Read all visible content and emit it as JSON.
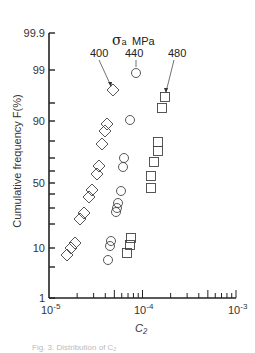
{
  "chart_data": {
    "type": "scatter",
    "title": "",
    "legend_title": "σa MPa",
    "xlabel": "C2",
    "ylabel": "Cumulative frequency  F(%)",
    "xscale": "log",
    "yscale": "probability",
    "xlim": [
      1e-05,
      0.001
    ],
    "ylim": [
      1,
      99.9
    ],
    "x_tick_labels": [
      "10-5",
      "10-4",
      "10-3"
    ],
    "y_tick_labels": [
      "1",
      "10",
      "50",
      "90",
      "99",
      "99.9"
    ],
    "grid": false,
    "series": [
      {
        "name": "400",
        "marker": "diamond",
        "points": [
          [
            4.8e-05,
            96.5
          ],
          [
            4.2e-05,
            88
          ],
          [
            4e-05,
            85
          ],
          [
            3.7e-05,
            78
          ],
          [
            3.4e-05,
            65
          ],
          [
            3.3e-05,
            60
          ],
          [
            2.9e-05,
            45
          ],
          [
            2.7e-05,
            38
          ],
          [
            2.4e-05,
            27
          ],
          [
            2.1e-05,
            23
          ],
          [
            1.9e-05,
            11
          ],
          [
            1.7e-05,
            10
          ],
          [
            1.6e-05,
            8
          ]
        ]
      },
      {
        "name": "440",
        "marker": "circle",
        "points": [
          [
            8.1e-05,
            98.8
          ],
          [
            7.2e-05,
            90
          ],
          [
            6.4e-05,
            70
          ],
          [
            6.2e-05,
            64
          ],
          [
            5.9e-05,
            45
          ],
          [
            5.5e-05,
            35
          ],
          [
            5.3e-05,
            31
          ],
          [
            5.2e-05,
            28
          ],
          [
            4.6e-05,
            12
          ],
          [
            4.5e-05,
            10.5
          ],
          [
            4.3e-05,
            7
          ]
        ]
      },
      {
        "name": "480",
        "marker": "square",
        "points": [
          [
            0.00018,
            97
          ],
          [
            0.00017,
            95
          ],
          [
            0.00015,
            80
          ],
          [
            0.00015,
            76
          ],
          [
            0.00014,
            68
          ],
          [
            0.00013,
            57
          ],
          [
            0.00013,
            47
          ],
          [
            9.5e-05,
            13
          ],
          [
            9.3e-05,
            11
          ],
          [
            8.8e-05,
            9
          ]
        ]
      }
    ]
  },
  "labels": {
    "ylabel": "Cumulative frequency  F(%)",
    "xlabel": "C₂",
    "legend_title": "σ",
    "legend_sub": "a",
    "legend_unit": "MPa",
    "series_400": "400",
    "series_440": "440",
    "series_480": "480",
    "caption": "Fig. 3.  Distribution of C₂"
  },
  "ticks": {
    "y": [
      {
        "label": "99.9",
        "py": 33
      },
      {
        "label": "99",
        "py": 70
      },
      {
        "label": "90",
        "py": 121
      },
      {
        "label": "50",
        "py": 183
      },
      {
        "label": "10",
        "py": 248
      },
      {
        "label": "1",
        "py": 298
      }
    ],
    "y_minor_py": [
      103,
      141,
      158,
      171,
      194,
      208,
      224,
      267
    ],
    "x": [
      {
        "label": "10",
        "exp": "-5",
        "px": 49
      },
      {
        "label": "10",
        "exp": "-4",
        "px": 142
      },
      {
        "label": "10",
        "exp": "-3",
        "px": 236
      }
    ]
  },
  "markers_px": {
    "diamonds": [
      [
        113,
        90
      ],
      [
        107,
        124
      ],
      [
        105,
        131
      ],
      [
        102,
        144
      ],
      [
        99,
        166
      ],
      [
        97,
        174
      ],
      [
        92,
        190
      ],
      [
        89,
        197
      ],
      [
        84,
        213
      ],
      [
        80,
        219
      ],
      [
        75,
        243
      ],
      [
        71,
        248
      ],
      [
        67,
        255
      ]
    ],
    "circles": [
      [
        136,
        73
      ],
      [
        130,
        120
      ],
      [
        124,
        158
      ],
      [
        123,
        167
      ],
      [
        121,
        191
      ],
      [
        118,
        203
      ],
      [
        117,
        208
      ],
      [
        116,
        212
      ],
      [
        111,
        241
      ],
      [
        110,
        246
      ],
      [
        108,
        260
      ]
    ],
    "squares": [
      [
        165,
        97
      ],
      [
        162,
        108
      ],
      [
        158,
        142
      ],
      [
        158,
        151
      ],
      [
        154,
        162
      ],
      [
        151,
        176
      ],
      [
        151,
        188
      ],
      [
        131,
        238
      ],
      [
        130,
        245
      ],
      [
        127,
        253
      ]
    ]
  }
}
